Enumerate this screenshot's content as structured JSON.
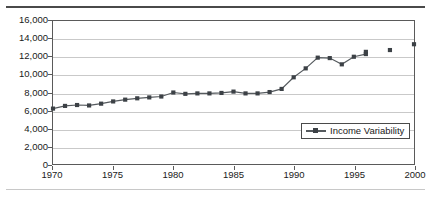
{
  "figure": {
    "background_color": "#ffffff",
    "frame_color": "#5a5a5a",
    "grid_color": "#c9c9c9"
  },
  "legend": {
    "position": "inside-bottom-right",
    "entries": [
      {
        "label": "Income Variability",
        "color": "#3c4146"
      }
    ]
  },
  "axes": {
    "y_ticklabels": [
      "16,000",
      "14,000",
      "12,000",
      "10,000",
      "8,000",
      "6,000",
      "4,000",
      "2,000",
      "0"
    ],
    "x_ticklabels": [
      "1970",
      "1975",
      "1980",
      "1985",
      "1990",
      "1995",
      "2000"
    ]
  },
  "chart_data": {
    "type": "line",
    "title": "",
    "xlabel": "",
    "ylabel": "",
    "xlim": [
      1970,
      2000
    ],
    "ylim": [
      0,
      16000
    ],
    "ytick_step": 2000,
    "xtick_step": 5,
    "grid": true,
    "legend_position": "inside-bottom-right",
    "marker": "square",
    "marker_color": "#3c4146",
    "line_color": "#555a5e",
    "series": [
      {
        "name": "Income Variability",
        "x": [
          1970,
          1971,
          1972,
          1973,
          1974,
          1975,
          1976,
          1977,
          1978,
          1979,
          1980,
          1981,
          1982,
          1983,
          1984,
          1985,
          1986,
          1987,
          1988,
          1989,
          1990,
          1991,
          1992,
          1993,
          1994,
          1995,
          1996
        ],
        "values": [
          6200,
          6500,
          6600,
          6550,
          6750,
          7000,
          7200,
          7350,
          7450,
          7550,
          8000,
          7850,
          7900,
          7900,
          7950,
          8100,
          7900,
          7900,
          8050,
          8400,
          9700,
          10700,
          11900,
          11850,
          11150,
          12000,
          12300
        ],
        "connected": true
      },
      {
        "name": "Income Variability (isolated points)",
        "x": [
          1996,
          1998,
          2000
        ],
        "values": [
          12550,
          12750,
          13400
        ],
        "connected": false,
        "note": "trailing markers drawn without connecting line segments"
      }
    ]
  }
}
